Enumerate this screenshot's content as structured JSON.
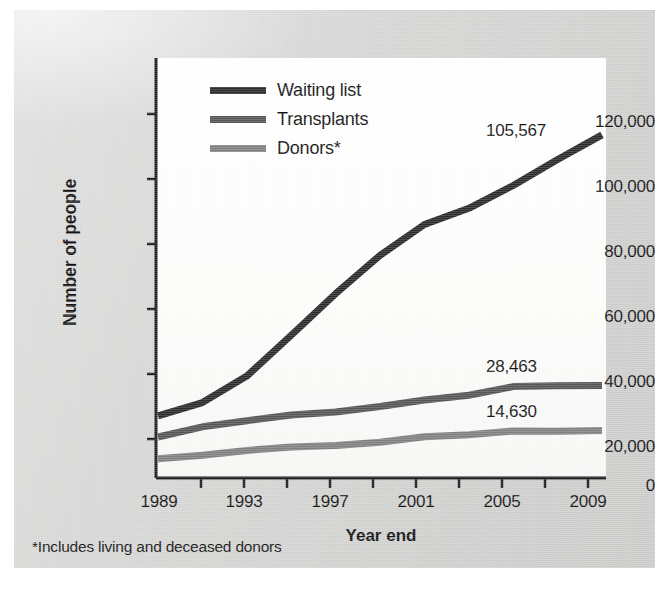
{
  "figure": {
    "footnote": "*Includes living and deceased donors",
    "panel_color": "#d3d3d2",
    "plot_background": "#fbfbfa"
  },
  "chart_data": {
    "type": "line",
    "title": "",
    "xlabel": "Year end",
    "ylabel": "Number of people",
    "xlim": [
      1989,
      2009
    ],
    "ylim": [
      0,
      130000
    ],
    "ytick_values": [
      0,
      20000,
      40000,
      60000,
      80000,
      100000,
      120000
    ],
    "ytick_labels": [
      "0",
      "20,000",
      "40,000",
      "60,000",
      "80,000",
      "100,000",
      "120,000"
    ],
    "xtick_labels": [
      "1989",
      "1993",
      "1997",
      "2001",
      "2005",
      "2009"
    ],
    "xtick_values": [
      1989,
      1993,
      1997,
      2001,
      2005,
      2009
    ],
    "minor_xtick_values": [
      1991,
      1995,
      1999,
      2003,
      2007
    ],
    "grid": false,
    "legend_position": "upper-left-inside",
    "x": [
      1989,
      1991,
      1993,
      1995,
      1997,
      1999,
      2001,
      2003,
      2005,
      2007,
      2009
    ],
    "series": [
      {
        "name": "Waiting list",
        "color": "#2b2b2b",
        "values": [
          19095,
          23198,
          31355,
          43937,
          56716,
          68500,
          78000,
          83000,
          90000,
          98000,
          105567
        ],
        "end_label": "105,567"
      },
      {
        "name": "Transplants",
        "color": "#565656",
        "values": [
          12623,
          15756,
          17630,
          19396,
          20300,
          21990,
          24000,
          25469,
          28110,
          28356,
          28463
        ],
        "end_label": "28,463"
      },
      {
        "name": "Donors*",
        "color": "#808080",
        "values": [
          5900,
          7000,
          8500,
          9500,
          10000,
          11000,
          12700,
          13300,
          14500,
          14400,
          14630
        ],
        "end_label": "14,630"
      }
    ]
  },
  "legend": {
    "items": [
      {
        "label": "Waiting list",
        "color": "#2b2b2b"
      },
      {
        "label": "Transplants",
        "color": "#565656"
      },
      {
        "label": "Donors*",
        "color": "#808080"
      }
    ]
  },
  "axes": {
    "y_title": "Number of people",
    "x_title": "Year end"
  }
}
